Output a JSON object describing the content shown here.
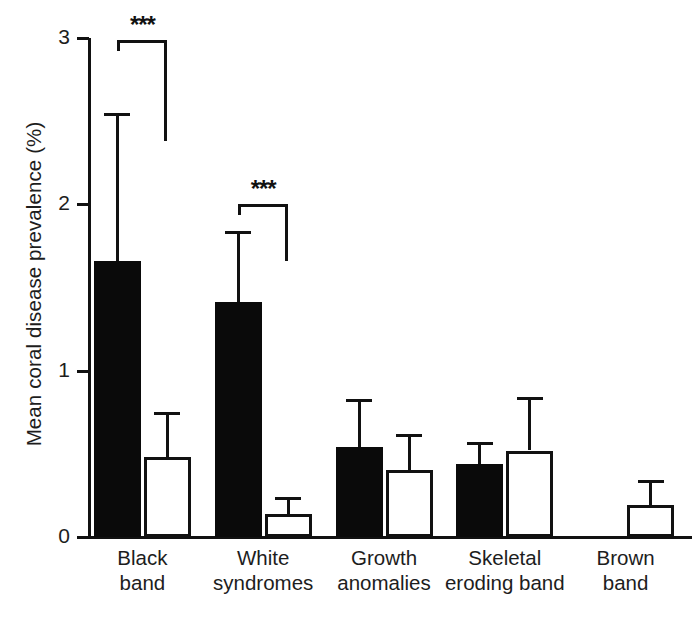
{
  "chart_data": {
    "type": "bar",
    "title": "",
    "xlabel": "",
    "ylabel": "Mean coral disease prevalence (%)",
    "ylim": [
      0,
      3
    ],
    "yticks": [
      "0",
      "1",
      "2",
      "3"
    ],
    "ytick_values": [
      0,
      1,
      2,
      3
    ],
    "grid": false,
    "legend": "none",
    "categories": [
      "Black band",
      "White syndromes",
      "Growth anomalies",
      "Skeletal eroding band",
      "Brown band"
    ],
    "category_lines": [
      [
        "Black",
        "band"
      ],
      [
        "White",
        "syndromes"
      ],
      [
        "Growth",
        "anomalies"
      ],
      [
        "Skeletal",
        "eroding band"
      ],
      [
        "Brown",
        "band"
      ]
    ],
    "series": [
      {
        "name": "filled",
        "fill": "#0a0a0a",
        "values": [
          1.66,
          1.41,
          0.54,
          0.44,
          0.0
        ],
        "errors_upper": [
          2.55,
          1.84,
          0.83,
          0.57,
          0.0
        ]
      },
      {
        "name": "open",
        "fill": "#ffffff",
        "values": [
          0.48,
          0.14,
          0.4,
          0.52,
          0.19
        ],
        "errors_upper": [
          0.75,
          0.24,
          0.62,
          0.84,
          0.34
        ]
      }
    ],
    "annotations": [
      {
        "label": "***",
        "category": "Black band",
        "bracket_top": 2.99,
        "bracket_right_drop": 2.38
      },
      {
        "label": "***",
        "category": "White syndromes",
        "bracket_top": 2.0,
        "bracket_right_drop": 1.66
      }
    ],
    "axis_color": "#111111"
  }
}
